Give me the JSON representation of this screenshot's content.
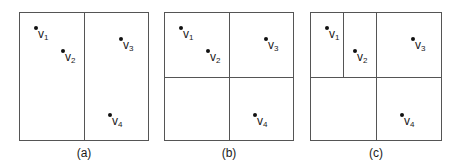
{
  "panels": [
    {
      "caption": "(a)",
      "points": [
        {
          "name": "v",
          "sub": "1"
        },
        {
          "name": "v",
          "sub": "2"
        },
        {
          "name": "v",
          "sub": "3"
        },
        {
          "name": "v",
          "sub": "4"
        }
      ]
    },
    {
      "caption": "(b)",
      "points": [
        {
          "name": "v",
          "sub": "1"
        },
        {
          "name": "v",
          "sub": "2"
        },
        {
          "name": "v",
          "sub": "3"
        },
        {
          "name": "v",
          "sub": "4"
        }
      ]
    },
    {
      "caption": "(c)",
      "points": [
        {
          "name": "v",
          "sub": "1"
        },
        {
          "name": "v",
          "sub": "2"
        },
        {
          "name": "v",
          "sub": "3"
        },
        {
          "name": "v",
          "sub": "4"
        }
      ]
    }
  ]
}
